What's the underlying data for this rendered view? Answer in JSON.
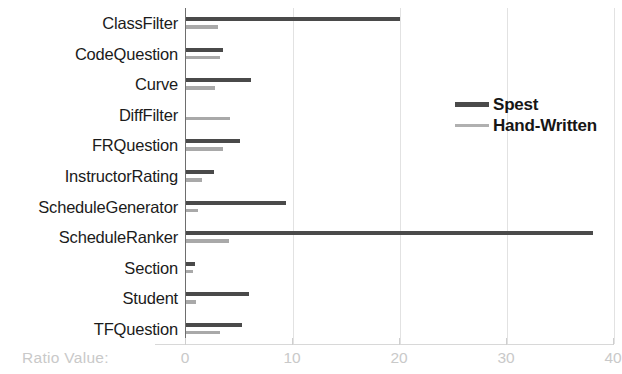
{
  "chart_data": {
    "type": "bar",
    "orientation": "horizontal",
    "title": "",
    "xlabel": "Ratio Value:",
    "ylabel": "",
    "xlim": [
      0,
      40
    ],
    "xticks": [
      0,
      10,
      20,
      30,
      40
    ],
    "xtick_labels": [
      "0",
      "10",
      "20",
      "30",
      "40"
    ],
    "grid": true,
    "grid_axis": "x",
    "legend_position": "upper-right-inside",
    "categories": [
      "ClassFilter",
      "CodeQuestion",
      "Curve",
      "DiffFilter",
      "FRQuestion",
      "InstructorRating",
      "ScheduleGenerator",
      "ScheduleRanker",
      "Section",
      "Student",
      "TFQuestion"
    ],
    "series": [
      {
        "name": "Spest",
        "color": "#4a4a4a",
        "values": [
          20.0,
          3.5,
          6.1,
          0.0,
          5.0,
          2.6,
          9.3,
          38.0,
          0.8,
          5.9,
          5.2
        ]
      },
      {
        "name": "Hand-Written",
        "color": "#a9a9a9",
        "values": [
          3.0,
          3.2,
          2.7,
          4.1,
          3.5,
          1.5,
          1.1,
          4.0,
          0.7,
          0.9,
          3.2
        ]
      }
    ]
  },
  "legend": {
    "entries": [
      {
        "label": "Spest",
        "swatch": "spest"
      },
      {
        "label": "Hand-Written",
        "swatch": "hand"
      }
    ]
  },
  "axis": {
    "x_title": "Ratio Value:"
  },
  "colors": {
    "spest": "#4a4a4a",
    "hand_written": "#a9a9a9",
    "grid": "#e2e2e2",
    "axis_text": "#c9c9c9",
    "label_text": "#1b1b1b"
  }
}
